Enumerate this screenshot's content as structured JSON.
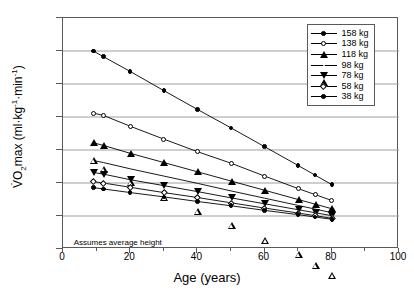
{
  "chart_data": {
    "type": "line",
    "title": "",
    "xlabel": "Age (years)",
    "ylabel": "V̇O2max (ml·kg⁻¹·min⁻¹)",
    "xlim": [
      0,
      100
    ],
    "ylim": [
      0,
      70
    ],
    "xticks": [
      0,
      20,
      40,
      60,
      80,
      100
    ],
    "yticks": [
      0,
      10,
      20,
      30,
      40,
      50,
      60,
      70
    ],
    "x_minor_ticks": [
      10,
      30,
      50,
      70,
      90
    ],
    "grid": "horizontal",
    "legend_position": "top-right",
    "annotation": "Assumes average height",
    "x": [
      9,
      12,
      20,
      30,
      40,
      50,
      60,
      70,
      75,
      80
    ],
    "series": [
      {
        "name": "158 kg",
        "marker": "circle-f",
        "values": [
          60.0,
          58.3,
          53.8,
          48.0,
          42.3,
          36.7,
          31.0,
          25.3,
          22.4,
          19.5
        ]
      },
      {
        "name": "138 kg",
        "marker": "circle-o",
        "values": [
          41.2,
          40.5,
          37.2,
          33.3,
          29.5,
          26.0,
          22.1,
          18.3,
          16.5,
          14.7
        ]
      },
      {
        "name": "118 kg",
        "marker": "tri-f",
        "values": [
          32.2,
          31.4,
          29.0,
          26.2,
          23.4,
          20.6,
          17.8,
          15.0,
          13.6,
          12.2
        ]
      },
      {
        "name": "98 kg",
        "marker": "tri-o",
        "values": [
          26.8,
          26.2,
          24.3,
          22.1,
          19.9,
          17.6,
          15.4,
          13.2,
          12.1,
          11.0
        ]
      },
      {
        "name": "78 kg",
        "marker": "tridown-f",
        "values": [
          23.2,
          22.7,
          21.0,
          19.2,
          17.4,
          15.5,
          13.7,
          11.9,
          11.0,
          10.1
        ]
      },
      {
        "name": "58 kg",
        "marker": "diamond-o",
        "values": [
          20.4,
          20.0,
          18.7,
          17.1,
          15.6,
          14.0,
          12.4,
          10.9,
          10.1,
          9.3
        ]
      },
      {
        "name": "38 kg",
        "marker": "circle-f",
        "values": [
          18.6,
          18.2,
          17.1,
          15.8,
          14.4,
          13.1,
          11.7,
          10.4,
          9.7,
          9.0
        ]
      }
    ]
  }
}
